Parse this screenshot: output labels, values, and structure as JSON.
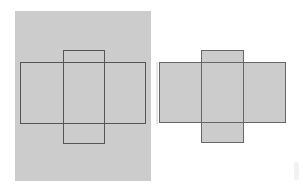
{
  "diagram": {
    "colors": {
      "background": "#ffffff",
      "sheet": "#cccccc",
      "outline": "#555555",
      "fill": "#cccccc"
    },
    "left_figure": {
      "sheet": {
        "x": 15,
        "y": 11,
        "w": 136,
        "h": 170
      },
      "wide_rect": {
        "x": 20,
        "y": 62,
        "w": 126,
        "h": 62
      },
      "tall_rect": {
        "x": 63,
        "y": 50,
        "w": 42,
        "h": 94
      }
    },
    "right_figure": {
      "wide_rect": {
        "x": 159,
        "y": 62,
        "w": 127,
        "h": 61
      },
      "tall_rect": {
        "x": 201,
        "y": 50,
        "w": 43,
        "h": 93
      }
    }
  }
}
